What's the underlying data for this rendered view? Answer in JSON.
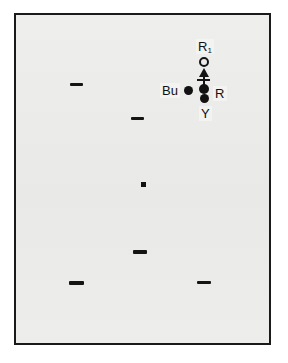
{
  "figure": {
    "kind": "chromatography-plate-diagram",
    "background_color": "#ffffff",
    "plate_color": "#ececeb",
    "ink_color": "#141414",
    "plate": {
      "x": 14,
      "y": 13,
      "width": 257,
      "height": 332,
      "border_width": 2
    }
  },
  "labels": {
    "r1": "R",
    "r1_sub": "1",
    "bu": "Bu",
    "r": "R",
    "y": "Y"
  },
  "marks": {
    "spots": [
      {
        "name": "r1-open-spot",
        "shape": "open-circle",
        "x": 204,
        "y": 62,
        "d": 9
      },
      {
        "name": "r-spot-upper",
        "shape": "filled-circle",
        "x": 204,
        "y": 89,
        "d": 10
      },
      {
        "name": "r-spot-lower",
        "shape": "filled-circle",
        "x": 204,
        "y": 98,
        "d": 9
      },
      {
        "name": "bu-spot",
        "shape": "filled-circle",
        "x": 188,
        "y": 90,
        "d": 9
      },
      {
        "name": "center-spot",
        "shape": "small-square",
        "x": 143,
        "y": 184,
        "d": 5
      }
    ],
    "bands": [
      {
        "name": "band-upper-left",
        "x": 70,
        "y": 83,
        "w": 13,
        "h": 3
      },
      {
        "name": "band-mid-left",
        "x": 131,
        "y": 117,
        "w": 13,
        "h": 3
      },
      {
        "name": "band-lower-mid",
        "x": 133,
        "y": 250,
        "w": 14,
        "h": 4
      },
      {
        "name": "band-bottom-left",
        "x": 69,
        "y": 281,
        "w": 15,
        "h": 4
      },
      {
        "name": "band-bottom-right",
        "x": 197,
        "y": 281,
        "w": 14,
        "h": 3
      }
    ],
    "arrow": {
      "name": "migration-arrow",
      "direction": "up",
      "shaft_x": 204,
      "shaft_top": 70,
      "shaft_bottom": 92,
      "head_y": 68,
      "crossbar_y": 79,
      "crossbar_w": 13
    }
  }
}
